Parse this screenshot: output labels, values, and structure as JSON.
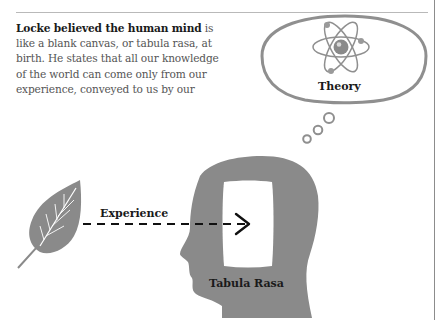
{
  "intro": {
    "lead_bold": "Locke believed the human mind",
    "body": " is like a blank canvas, or tabula rasa, at birth. He states that all our knowledge of the world can come only from our experience, conveyed to us by our senses. We can then rationalize this knowledge to formulate new ideas."
  },
  "diagram": {
    "theory_label": "Theory",
    "experience_label": "Experience",
    "tabula_label": "Tabula Rasa",
    "icons": {
      "thought_bubble": "thought-bubble-icon",
      "atom": "atom-icon",
      "leaf": "leaf-icon",
      "head": "head-profile-icon",
      "arrow": "dashed-arrow-icon"
    },
    "colors": {
      "silhouette": "#8a8a8a",
      "outline": "#8f8f8f",
      "text": "#1a1a1a",
      "body_text": "#555555",
      "rule": "#b9b9b9"
    }
  }
}
